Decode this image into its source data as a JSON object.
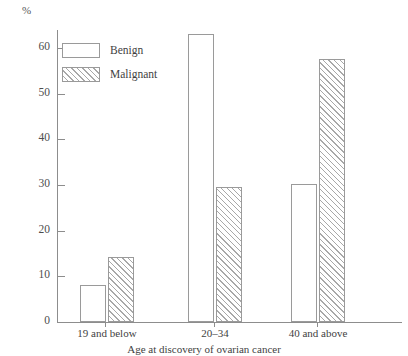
{
  "chart_data": {
    "type": "bar",
    "title": "",
    "subtitle": "",
    "xlabel": "Age at discovery of ovarian cancer",
    "ylabel": "%",
    "categories": [
      "19 and below",
      "20–34",
      "40 and above"
    ],
    "series": [
      {
        "name": "Benign",
        "values": [
          8.0,
          63.0,
          30.3
        ]
      },
      {
        "name": "Malignant",
        "values": [
          14.3,
          29.5,
          57.5
        ]
      }
    ],
    "ylim": [
      0,
      65
    ],
    "yticks": [
      0,
      10,
      20,
      30,
      40,
      50,
      60
    ],
    "ytick_labels": [
      "0",
      "10",
      "20",
      "30",
      "40",
      "50",
      "60"
    ],
    "grid": false,
    "legend_position": "upper-left-inside",
    "legend_entries": [
      "Benign",
      "Malignant"
    ],
    "styles": {
      "benign_fill": "#ffffff",
      "malignant_fill": "#ffffff",
      "hatch": "forward-diagonal",
      "line_color": "#9a9a9a",
      "axis_color": "#8d8d8d",
      "text_color": "#3f3f3f",
      "background": "#ffffff"
    }
  }
}
